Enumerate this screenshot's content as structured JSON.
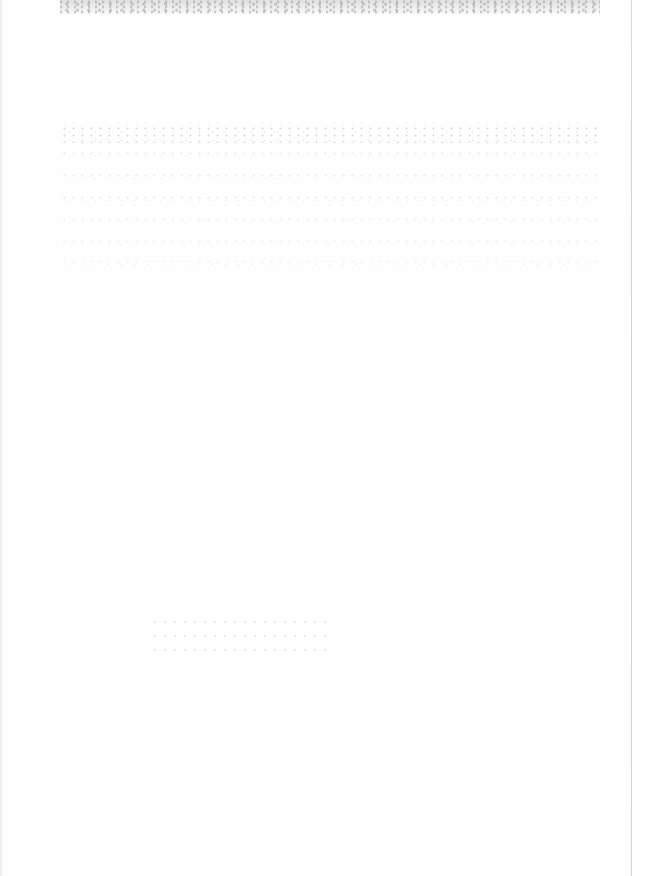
{
  "document": {
    "type": "scanned-page",
    "legible_text": "",
    "heading_fragment": "",
    "colors": {
      "paper": "#fefefe",
      "noise": "#9a9a9a",
      "edge_line": "#d2d2d2"
    }
  }
}
